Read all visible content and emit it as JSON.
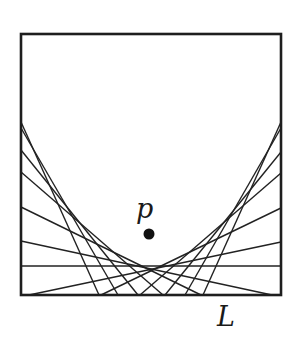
{
  "diagram": {
    "frame": {
      "x1": 21,
      "y1": 34,
      "x2": 281,
      "y2": 295
    },
    "colors": {
      "stroke": "#222222",
      "frame": "#1e1e1e",
      "point": "#111111",
      "background": "#ffffff"
    },
    "point": {
      "label": "p",
      "cx": 149,
      "cy": 234,
      "r": 5.5,
      "label_x": 136,
      "label_y": 218
    },
    "directrix": {
      "label": "L",
      "label_x": 217,
      "label_y": 326
    },
    "tangent_lines": [
      {
        "x1": 21,
        "y1": 122,
        "x2": 99,
        "y2": 295
      },
      {
        "x1": 21,
        "y1": 128,
        "x2": 118,
        "y2": 295
      },
      {
        "x1": 21,
        "y1": 150,
        "x2": 138,
        "y2": 295
      },
      {
        "x1": 21,
        "y1": 172,
        "x2": 163,
        "y2": 295
      },
      {
        "x1": 21,
        "y1": 207,
        "x2": 201,
        "y2": 295
      },
      {
        "x1": 21,
        "y1": 241,
        "x2": 272,
        "y2": 295
      },
      {
        "x1": 21,
        "y1": 266,
        "x2": 281,
        "y2": 266
      },
      {
        "x1": 281,
        "y1": 122,
        "x2": 203,
        "y2": 295
      },
      {
        "x1": 281,
        "y1": 128,
        "x2": 185,
        "y2": 295
      },
      {
        "x1": 281,
        "y1": 152,
        "x2": 165,
        "y2": 295
      },
      {
        "x1": 281,
        "y1": 173,
        "x2": 140,
        "y2": 295
      },
      {
        "x1": 281,
        "y1": 208,
        "x2": 101,
        "y2": 295
      },
      {
        "x1": 281,
        "y1": 242,
        "x2": 29,
        "y2": 295
      }
    ]
  }
}
